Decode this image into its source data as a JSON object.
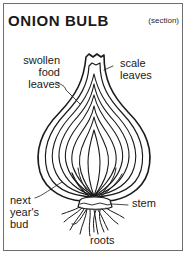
{
  "title": "ONION BULB",
  "subtitle": "(section)",
  "labels": {
    "swollen_food_leaves": [
      "swollen",
      "food",
      "leaves"
    ],
    "scale_leaves": [
      "scale",
      "leaves"
    ],
    "next_years_bud": [
      "next",
      "year's",
      "bud"
    ],
    "stem": "stem",
    "roots": "roots"
  },
  "colors": {
    "ink": "#1a1a1a",
    "border": "#6e6e6e",
    "background": "#ffffff"
  }
}
